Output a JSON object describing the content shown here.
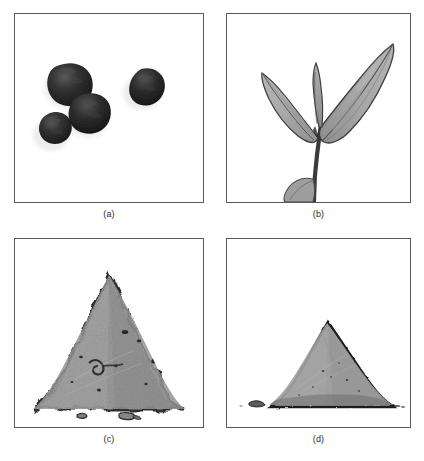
{
  "figure": {
    "width": 424,
    "height": 461,
    "background_color": "#ffffff",
    "border_color": "#5a5a5a",
    "layout": "2x2 grid of bordered square photo panels with captions below each"
  },
  "panels": [
    {
      "id": "a",
      "caption": "(a)",
      "subject": "fruits",
      "content_name": "dark-berries-photo",
      "description": "Four dark, nearly black, irregular rounded fruits scattered on a white background",
      "item_count": 4,
      "fill_color": "#232323",
      "shadow_color": "#3d3d3d",
      "highlight_color": "#4e4e4e",
      "background_color": "#ffffff",
      "items": [
        {
          "name": "berry-upper-left",
          "cx": 49,
          "cy": 52,
          "rx": 21,
          "ry": 19,
          "rot": -12
        },
        {
          "name": "berry-center",
          "cx": 70,
          "cy": 82,
          "rx": 20,
          "ry": 18,
          "rot": 8
        },
        {
          "name": "berry-lower-left",
          "cx": 33,
          "cy": 100,
          "rx": 16,
          "ry": 15,
          "rot": 20
        },
        {
          "name": "berry-right",
          "cx": 124,
          "cy": 57,
          "rx": 17,
          "ry": 16,
          "rot": -5
        }
      ]
    },
    {
      "id": "b",
      "caption": "(b)",
      "subject": "leaf-shoot",
      "content_name": "tea-shoot-photo",
      "description": "A tea plant shoot with two open lanceolate leaves, an upright bud and a small lower leaf on a dark stem",
      "leaf_count": 3,
      "bud_count": 1,
      "fill_color": "#9b9b9b",
      "leaf_light_color": "#aeaeae",
      "leaf_dark_color": "#878787",
      "outline_color": "#3c3c3c",
      "stem_color": "#3a3a3a",
      "background_color": "#ffffff",
      "parts": [
        {
          "name": "leaf-right-large",
          "orientation": "upper-right",
          "length_px": 120
        },
        {
          "name": "leaf-left",
          "orientation": "upper-left",
          "length_px": 80
        },
        {
          "name": "bud-center",
          "orientation": "vertical",
          "length_px": 70
        },
        {
          "name": "leaf-lower-small",
          "orientation": "lower-left",
          "length_px": 32
        },
        {
          "name": "stem",
          "orientation": "vertical",
          "length_px": 120
        }
      ]
    },
    {
      "id": "c",
      "caption": "(c)",
      "subject": "powder-pile",
      "content_name": "coarse-powder-pile-photo",
      "description": "A conical pile of coarse, granular, lumpy powder with a rough jagged outline and scattered loose particles at its base",
      "texture": "coarse",
      "fill_color": "#9e9e9e",
      "fill_dark_color": "#868686",
      "outline_color": "#2c2c2c",
      "speck_color": "#1f1f1f",
      "background_color": "#ffffff",
      "debris_count": 3,
      "pile_apex": {
        "x": 92,
        "y": 52
      },
      "pile_base": {
        "left_x": 18,
        "right_x": 168,
        "y": 166
      }
    },
    {
      "id": "d",
      "caption": "(d)",
      "subject": "powder-pile",
      "content_name": "fine-powder-pile-photo",
      "description": "A conical pile of fine, smooth powder with clean even slopes and a dark crisp outline",
      "texture": "fine",
      "fill_color": "#a3a3a3",
      "fill_dark_color": "#8d8d8d",
      "outline_color": "#1c1c1c",
      "speck_color": "#2a2a2a",
      "background_color": "#ffffff",
      "debris_count": 2,
      "pile_apex": {
        "x": 100,
        "y": 85
      },
      "pile_base": {
        "left_x": 40,
        "right_x": 162,
        "y": 166
      }
    }
  ]
}
